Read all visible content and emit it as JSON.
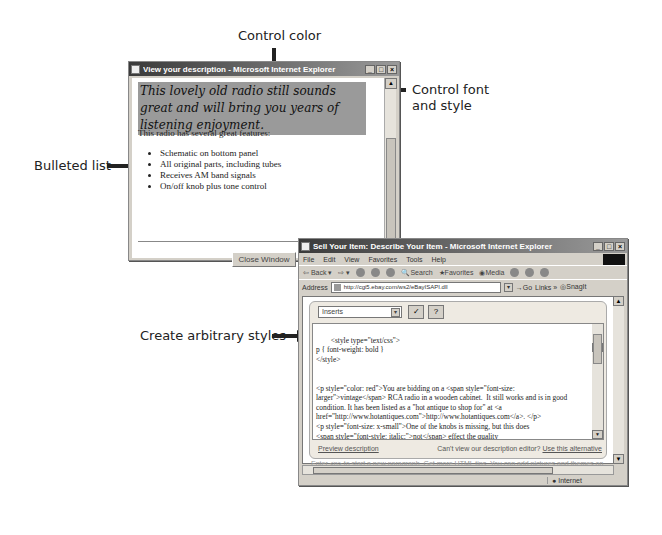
{
  "callouts": {
    "control_color": "Control color",
    "control_font_line1": "Control font",
    "control_font_line2": "and style",
    "bulleted_list": "Bulleted list",
    "arbitrary_styles": "Create arbitrary styles"
  },
  "preview_window": {
    "title": "View your description - Microsoft Internet Explorer",
    "banner_text": "This lovely old radio still sounds great and will bring you years of listening enjoyment.",
    "intro": "This radio has several great features:",
    "features": [
      "Schematic on bottom panel",
      "All original parts, including tubes",
      "Receives AM band signals",
      "On/off knob plus tone control"
    ],
    "close_button": "Close Window"
  },
  "editor_window": {
    "title": "Sell Your Item: Describe Your Item - Microsoft Internet Explorer",
    "menu": [
      "File",
      "Edit",
      "View",
      "Favorites",
      "Tools",
      "Help"
    ],
    "toolbar": [
      "Back",
      "Search",
      "Favorites",
      "Media"
    ],
    "address_label": "Address",
    "address_url": "http://cgi5.ebay.com/ws2/eBayISAPI.dll",
    "go_label": "Go",
    "links_label": "Links",
    "snagit_label": "SnagIt",
    "inserts_select": "Inserts",
    "editor_content": "<style type=\"text/css\">\np { font-weight: bold }\n</style>\n\n\n<p style=\"color: red\">You are bidding on a <span style=\"font-size:\nlarger\">vintage</span> RCA radio in a wooden cabinet.  It still works and is in good\ncondition. It has been listed as a \"hot antique to shop for\" at <a\nhref=\"http://www.hotantiques.com\">http://www.hotantiques.com</a>. </p>\n<p style=\"font-size: x-small\">One of the knobs is missing, but this does\n<span style=\"font-style: italic;\">not</span> effect the quality\nof the radio's performance.</p>",
    "preview_link": "Preview description",
    "cant_view_text": "Can't view our description editor?",
    "alternative_link": "Use this alternative",
    "hint_text": "Enter <p> to start a new paragraph. Get more HTML tips. You can add pictures and themes on",
    "status_zone": "Internet"
  }
}
